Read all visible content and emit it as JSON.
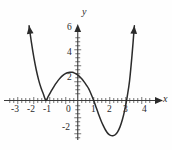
{
  "figure": {
    "kind": "cartesian-graph",
    "background_color": "#fefefe",
    "curve_color": "#2b2b2b",
    "axis_color": "#3a3a3a"
  },
  "axes": {
    "x_axis_label": "x",
    "y_axis_label": "y",
    "x_tick_labels": [
      "-3",
      "-2",
      "-1",
      "0",
      "1",
      "2",
      "3",
      "4"
    ],
    "y_tick_labels": [
      "6",
      "4",
      "2",
      "-2"
    ]
  },
  "chart_data": {
    "type": "line",
    "title": "",
    "xlabel": "x",
    "ylabel": "y",
    "xlim": [
      -3.4,
      4.3
    ],
    "ylim": [
      -3.6,
      6.8
    ],
    "xticks": [
      -3,
      -2,
      -1,
      0,
      1,
      2,
      3,
      4
    ],
    "yticks": [
      6,
      4,
      2,
      -2
    ],
    "xtick_labels": [
      "-3",
      "-2",
      "-1",
      "0",
      "1",
      "2",
      "3",
      "4"
    ],
    "ytick_labels": [
      "6",
      "4",
      "2",
      "-2"
    ],
    "grid": false,
    "legend": null,
    "minor_tick_spacing": 0.25,
    "series": [
      {
        "name": "quartic",
        "roots": [
          -2,
          -2,
          1,
          3
        ],
        "y_intercept": 2,
        "local_maximum": {
          "x": -0.2,
          "y": 2.2
        },
        "local_minima": [
          {
            "x": -2,
            "y": 0
          },
          {
            "x": 2.3,
            "y": -2.8
          }
        ],
        "arrow_endpoints": [
          {
            "x": -3.05,
            "y": 6.0
          },
          {
            "x": 3.55,
            "y": 6.0
          }
        ],
        "x": [
          -3.05,
          -2.9,
          -2.75,
          -2.6,
          -2.45,
          -2.3,
          -2.15,
          -2.0,
          -1.85,
          -1.7,
          -1.55,
          -1.4,
          -1.25,
          -1.1,
          -0.95,
          -0.8,
          -0.65,
          -0.5,
          -0.35,
          -0.2,
          -0.05,
          0.1,
          0.25,
          0.4,
          0.55,
          0.7,
          0.85,
          1.0,
          1.15,
          1.3,
          1.45,
          1.6,
          1.75,
          1.9,
          2.05,
          2.2,
          2.35,
          2.5,
          2.65,
          2.8,
          2.95,
          3.1,
          3.25,
          3.4,
          3.55
        ],
        "y": [
          6.0,
          4.62,
          3.44,
          2.45,
          1.64,
          1.0,
          0.51,
          0.0,
          0.33,
          0.68,
          1.0,
          1.31,
          1.58,
          1.81,
          2.0,
          2.14,
          2.23,
          2.27,
          2.26,
          2.2,
          2.09,
          1.94,
          1.74,
          1.5,
          1.22,
          0.91,
          0.47,
          0.0,
          -0.54,
          -1.08,
          -1.58,
          -2.02,
          -2.39,
          -2.66,
          -2.8,
          -2.83,
          -2.75,
          -2.52,
          -2.12,
          -1.53,
          -0.73,
          0.3,
          1.6,
          3.6,
          6.0
        ]
      }
    ]
  }
}
